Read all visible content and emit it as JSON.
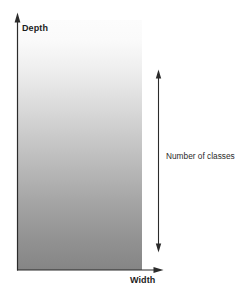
{
  "figure": {
    "type": "schematic-diagram",
    "background_color": "#ffffff"
  },
  "axes": {
    "y_axis": {
      "label": "Depth",
      "icon": "arrow-up-icon",
      "color": "#2b2b2b"
    },
    "x_axis": {
      "label": "Width",
      "icon": "arrow-right-icon",
      "color": "#2b2b2b"
    }
  },
  "annotation": {
    "label": "Number of classes",
    "icon": "double-arrow-vertical-icon",
    "color": "#2b2b2b"
  },
  "gradient_region": {
    "name": "depth-width-gradient",
    "top_color": "#fbfbfb",
    "mid_color": "#c8c8c8",
    "bottom_color": "#868686"
  }
}
